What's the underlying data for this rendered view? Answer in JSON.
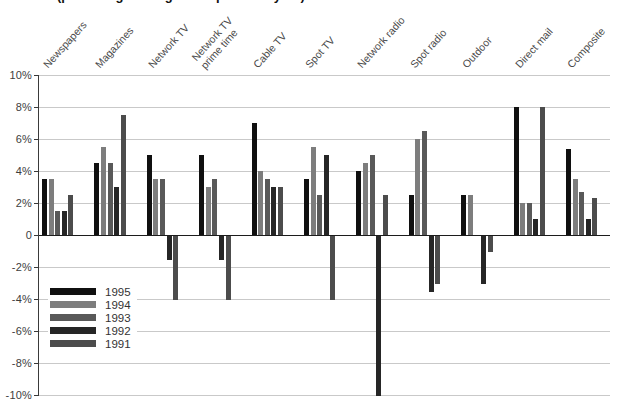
{
  "title": {
    "clipped_text": "(percentage change from previous year)"
  },
  "colors": {
    "background": "#ffffff",
    "gridline": "#c9c9c9",
    "zero_line": "#1c1c1c",
    "axis": "#3a3a3a",
    "label_text": "#4a4a4a"
  },
  "chart_data": {
    "type": "bar",
    "categories": [
      "Newspapers",
      "Magazines",
      "Network TV",
      "Network TV\nprime time",
      "Cable TV",
      "Spot TV",
      "Network radio",
      "Spot radio",
      "Outdoor",
      "Direct mail",
      "Composite"
    ],
    "series": [
      {
        "name": "1995",
        "color": "#101010",
        "values": [
          3.5,
          4.5,
          5,
          5,
          7,
          3.5,
          4,
          2.5,
          2.5,
          8,
          5.4
        ]
      },
      {
        "name": "1994",
        "color": "#7d7d7d",
        "values": [
          3.5,
          5.5,
          3.5,
          3,
          4,
          5.5,
          4.5,
          6,
          2.5,
          2,
          3.5
        ]
      },
      {
        "name": "1993",
        "color": "#595959",
        "values": [
          1.5,
          4.5,
          3.5,
          3.5,
          3.5,
          2.5,
          5,
          6.5,
          null,
          2,
          2.7
        ]
      },
      {
        "name": "1992",
        "color": "#262626",
        "values": [
          1.5,
          3,
          -1.5,
          -1.5,
          3,
          5,
          -10,
          -3.5,
          -3,
          1,
          1
        ]
      },
      {
        "name": "1991",
        "color": "#4c4c4c",
        "values": [
          2.5,
          7.5,
          -4,
          -4,
          3,
          -4,
          2.5,
          -3,
          -1,
          8,
          2.3
        ]
      }
    ],
    "y_ticks": [
      "10%",
      "8%",
      "6%",
      "4%",
      "2%",
      "0",
      "-2%",
      "-4%",
      "-6%",
      "-8%",
      "-10%"
    ],
    "ylim": [
      -10,
      10
    ],
    "tick_step": 2,
    "grid": true,
    "legend_position": "bottom-left",
    "unit": "percent"
  }
}
